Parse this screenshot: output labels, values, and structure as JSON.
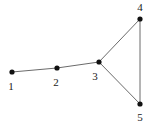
{
  "figure": {
    "name": "undirected-graph-diagram",
    "background_color": "#ffffff",
    "width": 151,
    "height": 124
  },
  "style": {
    "edge_color": "#6b6b6b",
    "edge_width": 1,
    "node_color": "#111111",
    "node_radius": 2.6,
    "label_color": "#1a1a1a",
    "label_font_size": 11
  },
  "chart_data": {
    "type": "diagram",
    "subtype": "node-link-graph",
    "title": "",
    "directed": false,
    "nodes": [
      {
        "id": "1",
        "label": "1",
        "x": 12,
        "y": 72,
        "label_x": 11,
        "label_y": 86
      },
      {
        "id": "2",
        "label": "2",
        "x": 57,
        "y": 68,
        "label_x": 56,
        "label_y": 82
      },
      {
        "id": "3",
        "label": "3",
        "x": 99,
        "y": 62,
        "label_x": 95,
        "label_y": 76
      },
      {
        "id": "4",
        "label": "4",
        "x": 140,
        "y": 19,
        "label_x": 140,
        "label_y": 7
      },
      {
        "id": "5",
        "label": "5",
        "x": 140,
        "y": 104,
        "label_x": 140,
        "label_y": 117
      }
    ],
    "edges": [
      {
        "source": "1",
        "target": "2"
      },
      {
        "source": "2",
        "target": "3"
      },
      {
        "source": "3",
        "target": "4"
      },
      {
        "source": "3",
        "target": "5"
      },
      {
        "source": "4",
        "target": "5"
      }
    ]
  }
}
